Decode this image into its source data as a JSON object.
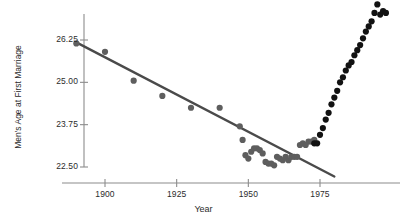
{
  "chart_data": {
    "type": "scatter",
    "title": "",
    "xlabel": "Year",
    "ylabel": "Men's Age at First Marriage",
    "xlim": [
      1885,
      2000
    ],
    "ylim": [
      22.1,
      27.6
    ],
    "xticks": [
      1900,
      1925,
      1950,
      1975
    ],
    "xtick_labels": [
      "1900",
      "1925",
      "1950",
      "1975"
    ],
    "yticks": [
      22.5,
      23.75,
      25.0,
      26.25
    ],
    "ytick_labels": [
      "22.50",
      "23.75",
      "25.00",
      "26.25"
    ],
    "grid": false,
    "legend": "none",
    "marker_size": 3.1,
    "series": [
      {
        "name": "declining-period",
        "color": "#5e5e5e",
        "points": [
          [
            1890,
            26.15
          ],
          [
            1900,
            25.9
          ],
          [
            1910,
            25.05
          ],
          [
            1920,
            24.6
          ],
          [
            1930,
            24.25
          ],
          [
            1940,
            24.25
          ],
          [
            1947,
            23.7
          ],
          [
            1948,
            23.3
          ],
          [
            1949,
            22.85
          ],
          [
            1950,
            22.75
          ],
          [
            1951,
            22.95
          ],
          [
            1952,
            23.05
          ],
          [
            1953,
            23.05
          ],
          [
            1954,
            23.0
          ],
          [
            1955,
            22.9
          ],
          [
            1956,
            22.65
          ],
          [
            1957,
            22.6
          ],
          [
            1958,
            22.6
          ],
          [
            1959,
            22.55
          ],
          [
            1960,
            22.8
          ],
          [
            1961,
            22.75
          ],
          [
            1962,
            22.7
          ],
          [
            1963,
            22.8
          ],
          [
            1964,
            22.7
          ],
          [
            1965,
            22.8
          ],
          [
            1966,
            22.8
          ],
          [
            1967,
            22.8
          ],
          [
            1968,
            23.15
          ],
          [
            1969,
            23.2
          ],
          [
            1970,
            23.15
          ],
          [
            1971,
            23.25
          ],
          [
            1972,
            23.25
          ],
          [
            1973,
            23.3
          ]
        ]
      },
      {
        "name": "rising-period",
        "color": "#121212",
        "points": [
          [
            1973,
            23.2
          ],
          [
            1974,
            23.2
          ],
          [
            1975,
            23.45
          ],
          [
            1976,
            23.65
          ],
          [
            1977,
            23.9
          ],
          [
            1978,
            24.1
          ],
          [
            1979,
            24.35
          ],
          [
            1980,
            24.55
          ],
          [
            1981,
            24.75
          ],
          [
            1982,
            25.0
          ],
          [
            1983,
            25.15
          ],
          [
            1984,
            25.35
          ],
          [
            1985,
            25.5
          ],
          [
            1986,
            25.6
          ],
          [
            1987,
            25.8
          ],
          [
            1988,
            25.95
          ],
          [
            1989,
            26.1
          ],
          [
            1990,
            26.3
          ],
          [
            1991,
            26.5
          ],
          [
            1992,
            26.65
          ],
          [
            1993,
            26.8
          ],
          [
            1994,
            27.05
          ],
          [
            1995,
            27.3
          ],
          [
            1996,
            27.0
          ],
          [
            1997,
            27.1
          ],
          [
            1998,
            27.05
          ]
        ]
      }
    ],
    "fit_line": {
      "name": "regression-line",
      "color": "#4a4a4a",
      "x_start": 1890,
      "y_start": 26.18,
      "x_end": 1980,
      "y_end": 22.22
    }
  }
}
